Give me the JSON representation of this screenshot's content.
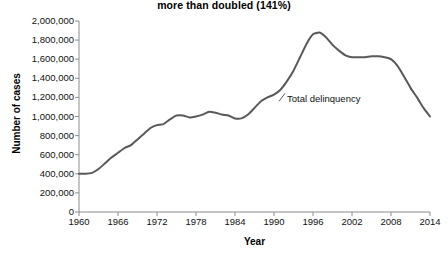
{
  "chart_data": {
    "type": "line",
    "title": "more than doubled (141%)",
    "xlabel": "Year",
    "ylabel": "Number of cases",
    "xlim": [
      1960,
      2014
    ],
    "ylim": [
      0,
      2000000
    ],
    "grid": false,
    "legend_position": "inline-annotation",
    "xticks": [
      "1960",
      "1966",
      "1972",
      "1978",
      "1984",
      "1990",
      "1996",
      "2002",
      "2008",
      "2014"
    ],
    "xtick_values": [
      1960,
      1966,
      1972,
      1978,
      1984,
      1990,
      1996,
      2002,
      2008,
      2014
    ],
    "yticks": [
      "0",
      "200,000",
      "400,000",
      "600,000",
      "800,000",
      "1,000,000",
      "1,200,000",
      "1,400,000",
      "1,600,000",
      "1,800,000",
      "2,000,000"
    ],
    "ytick_values": [
      0,
      200000,
      400000,
      600000,
      800000,
      1000000,
      1200000,
      1400000,
      1600000,
      1800000,
      2000000
    ],
    "annotations": [
      {
        "text": "Total delinquency",
        "x": 1992,
        "y": 1180000
      }
    ],
    "series": [
      {
        "name": "Total delinquency",
        "color": "#595959",
        "x": [
          1960,
          1961,
          1962,
          1963,
          1964,
          1965,
          1966,
          1967,
          1968,
          1969,
          1970,
          1971,
          1972,
          1973,
          1974,
          1975,
          1976,
          1977,
          1978,
          1979,
          1980,
          1981,
          1982,
          1983,
          1984,
          1985,
          1986,
          1987,
          1988,
          1989,
          1990,
          1991,
          1992,
          1993,
          1994,
          1995,
          1996,
          1997,
          1998,
          1999,
          2000,
          2001,
          2002,
          2003,
          2004,
          2005,
          2006,
          2007,
          2008,
          2009,
          2010,
          2011,
          2012,
          2013,
          2014
        ],
        "y": [
          400000,
          400000,
          410000,
          450000,
          510000,
          570000,
          620000,
          670000,
          700000,
          760000,
          820000,
          880000,
          910000,
          920000,
          970000,
          1010000,
          1010000,
          990000,
          1000000,
          1020000,
          1050000,
          1040000,
          1020000,
          1010000,
          980000,
          980000,
          1020000,
          1090000,
          1160000,
          1200000,
          1230000,
          1280000,
          1370000,
          1480000,
          1620000,
          1760000,
          1860000,
          1880000,
          1830000,
          1750000,
          1690000,
          1640000,
          1620000,
          1620000,
          1620000,
          1630000,
          1630000,
          1620000,
          1600000,
          1530000,
          1420000,
          1300000,
          1200000,
          1090000,
          1000000
        ]
      }
    ]
  }
}
